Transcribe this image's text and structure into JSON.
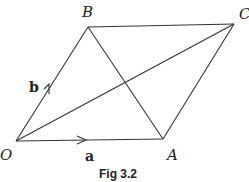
{
  "figure": {
    "caption": "Fig 3.2",
    "points": {
      "O": {
        "label": "O",
        "x": 16,
        "y": 141
      },
      "A": {
        "label": "A",
        "x": 163,
        "y": 139
      },
      "B": {
        "label": "B",
        "x": 88,
        "y": 27
      },
      "C": {
        "label": "C",
        "x": 234,
        "y": 24
      }
    },
    "vectors": {
      "a": {
        "label": "a",
        "from": "O",
        "to": "A"
      },
      "b": {
        "label": "b",
        "from": "O",
        "to": "B"
      }
    },
    "segments": [
      "OA",
      "OB",
      "BC",
      "AC",
      "OC",
      "AB"
    ],
    "line_color": "#333333"
  }
}
